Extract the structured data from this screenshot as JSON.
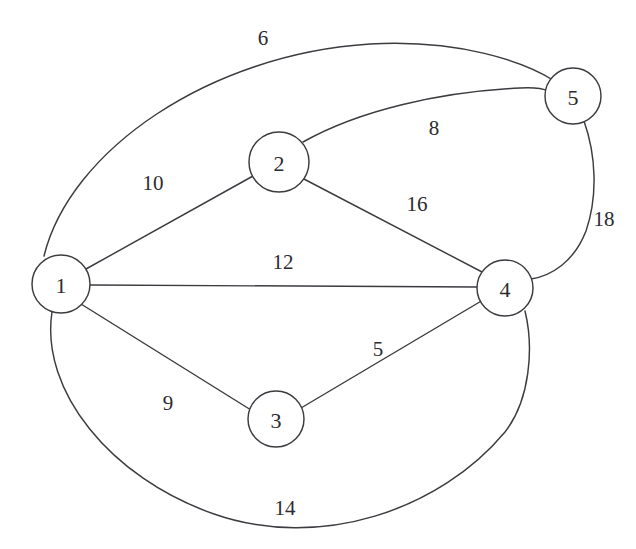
{
  "figure": {
    "kind": "weighted-undirected-graph",
    "width": 636,
    "height": 549,
    "background_color": "#ffffff",
    "stroke_color": "#3b3b40",
    "text_color": "#2b2b30"
  },
  "nodes": [
    {
      "id": "1",
      "label": "1",
      "cx": 61,
      "cy": 284,
      "r": 29
    },
    {
      "id": "2",
      "label": "2",
      "cx": 279,
      "cy": 162,
      "r": 30
    },
    {
      "id": "3",
      "label": "3",
      "cx": 276,
      "cy": 419,
      "r": 28
    },
    {
      "id": "4",
      "label": "4",
      "cx": 505,
      "cy": 288,
      "r": 28
    },
    {
      "id": "5",
      "label": "5",
      "cx": 573,
      "cy": 96,
      "r": 28
    }
  ],
  "edges": [
    {
      "id": "e1-5",
      "source": "1",
      "target": "5",
      "weight": "6",
      "shape": "arc",
      "label_x": 263,
      "label_y": 38
    },
    {
      "id": "e2-5",
      "source": "2",
      "target": "5",
      "weight": "8",
      "shape": "arc",
      "label_x": 434,
      "label_y": 128
    },
    {
      "id": "e1-2",
      "source": "1",
      "target": "2",
      "weight": "10",
      "shape": "straight",
      "label_x": 153,
      "label_y": 183
    },
    {
      "id": "e2-4",
      "source": "2",
      "target": "4",
      "weight": "16",
      "shape": "straight",
      "label_x": 417,
      "label_y": 204
    },
    {
      "id": "e1-4",
      "source": "1",
      "target": "4",
      "weight": "12",
      "shape": "straight",
      "label_x": 283,
      "label_y": 262
    },
    {
      "id": "e5-4",
      "source": "5",
      "target": "4",
      "weight": "18",
      "shape": "arc",
      "label_x": 604,
      "label_y": 219
    },
    {
      "id": "e3-4",
      "source": "3",
      "target": "4",
      "weight": "5",
      "shape": "straight",
      "label_x": 378,
      "label_y": 349
    },
    {
      "id": "e1-3",
      "source": "1",
      "target": "3",
      "weight": "9",
      "shape": "straight",
      "label_x": 168,
      "label_y": 403
    },
    {
      "id": "e1-4b",
      "source": "1",
      "target": "4",
      "weight": "14",
      "shape": "arc",
      "label_x": 285,
      "label_y": 508
    }
  ],
  "paths": {
    "e1-5": "M 44,256 C 70,150 210,54 370,44 C 460,39 524,62 553,80",
    "e2-5": "M 303,142 C 360,110 440,92 520,88 C 534,87 544,89 549,91",
    "e1-2": "M 86,269 L 253,176",
    "e2-4": "M 302,178 L 484,273",
    "e1-4": "M 90,285 L 477,287",
    "e5-4": "M 584,121 C 596,155 598,196 586,231 C 574,262 551,276 531,279",
    "e3-4": "M 301,408 L 483,300",
    "e1-3": "M 81,304 L 251,410",
    "e1-4b": "M 52,312 C 40,390 110,478 214,514 C 320,551 440,510 505,432 C 530,400 534,348 525,311"
  }
}
